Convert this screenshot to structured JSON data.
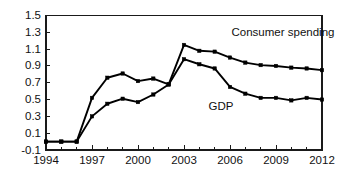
{
  "chart_data": {
    "type": "line",
    "title": "",
    "subtitle": "",
    "xlabel": "",
    "ylabel": "",
    "xlim": [
      1994,
      2012
    ],
    "ylim": [
      -0.1,
      1.5
    ],
    "grid": false,
    "legend_position": "inline-annotation",
    "y_ticks": [
      "-0.1",
      "0.1",
      "0.3",
      "0.5",
      "0.7",
      "0.9",
      "1.1",
      "1.3",
      "1.5"
    ],
    "y_tick_values": [
      -0.1,
      0.1,
      0.3,
      0.5,
      0.7,
      0.9,
      1.1,
      1.3,
      1.5
    ],
    "x_ticks": [
      "1994",
      "1997",
      "2000",
      "2003",
      "2006",
      "2009",
      "2012"
    ],
    "x_tick_values": [
      1994,
      1997,
      2000,
      2003,
      2006,
      2009,
      2012
    ],
    "x_minor_tick_values": [
      1995,
      1996,
      1998,
      1999,
      2001,
      2002,
      2004,
      2005,
      2007,
      2008,
      2010,
      2011
    ],
    "x": [
      1994,
      1995,
      1996,
      1997,
      1998,
      1999,
      2000,
      2001,
      2002,
      2003,
      2004,
      2005,
      2006,
      2007,
      2008,
      2009,
      2010,
      2011,
      2012
    ],
    "series": [
      {
        "name": "Consumer spending",
        "color": "#000000",
        "marker": "square",
        "label_x": 2006.1,
        "label_y": 1.26,
        "values": [
          0.0,
          0.0,
          0.0,
          0.52,
          0.76,
          0.81,
          0.72,
          0.75,
          0.68,
          1.15,
          1.08,
          1.07,
          1.0,
          0.94,
          0.91,
          0.9,
          0.88,
          0.87,
          0.85
        ]
      },
      {
        "name": "GDP",
        "color": "#000000",
        "marker": "square",
        "label_x": 2004.6,
        "label_y": 0.37,
        "values": [
          0.0,
          0.0,
          0.0,
          0.3,
          0.45,
          0.51,
          0.47,
          0.56,
          0.68,
          0.98,
          0.92,
          0.87,
          0.65,
          0.57,
          0.52,
          0.52,
          0.49,
          0.52,
          0.5
        ]
      }
    ]
  }
}
